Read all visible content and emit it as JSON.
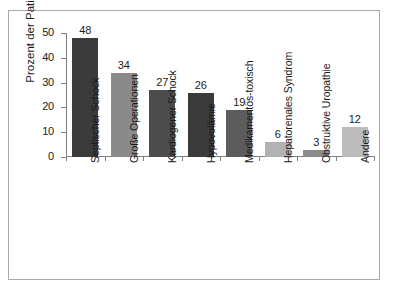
{
  "chart_data": {
    "type": "bar",
    "title": "",
    "xlabel": "",
    "ylabel": "Prozent der Patienten",
    "ylim": [
      0,
      50
    ],
    "yticks": [
      0,
      10,
      20,
      30,
      40,
      50
    ],
    "ytick_labels": [
      "0",
      "10",
      "20",
      "30",
      "40",
      "50"
    ],
    "grid": false,
    "legend": "none",
    "categories": [
      "Septischer Schock",
      "Große Operationen",
      "Kardiogener Schock",
      "Hypovolämie",
      "Medikamentös-toxisch",
      "Hepatorenales Syndrom",
      "Obstruktive Uropathie",
      "Andere"
    ],
    "values": [
      48,
      34,
      27,
      26,
      19,
      6,
      3,
      12
    ],
    "value_labels": [
      "48",
      "34",
      "27",
      "26",
      "19",
      "6",
      "3",
      "12"
    ],
    "bar_colors": [
      "#3b3b3b",
      "#8a8a8a",
      "#4c4c4c",
      "#3b3b3b",
      "#5c5c5c",
      "#b2b2b2",
      "#8c8c8c",
      "#bcbcbc"
    ]
  },
  "figure": {
    "background_color": "#ffffff",
    "frame_color": "#a9a9a9",
    "axis_color": "#808080",
    "text_color": "#1a1a1a"
  }
}
